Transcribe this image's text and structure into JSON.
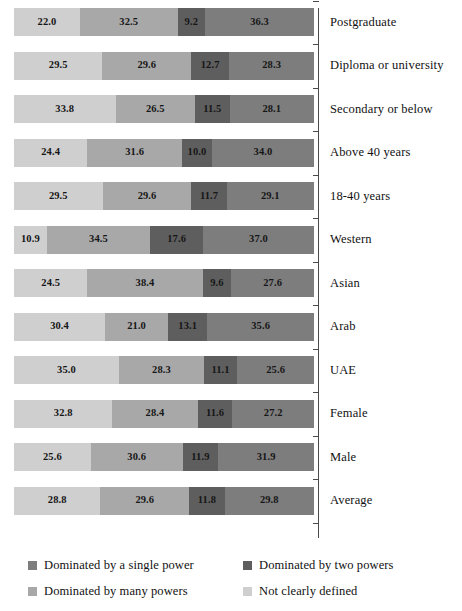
{
  "chart_data": {
    "type": "bar",
    "subtype": "horizontal-stacked-100",
    "title": "",
    "subtitle": "",
    "xlabel": "",
    "ylabel": "",
    "xlim": [
      0,
      100
    ],
    "grid": false,
    "legend_position": "bottom",
    "orientation": "horizontal",
    "categories": [
      "Postgraduate",
      "Diploma or university",
      "Secondary or below",
      "Above 40 years",
      "18-40 years",
      "Western",
      "Asian",
      "Arab",
      "UAE",
      "Female",
      "Male",
      "Average"
    ],
    "series": [
      {
        "name": "Not clearly defined",
        "color": "#cfcfcf",
        "values": [
          22.0,
          29.5,
          33.8,
          24.4,
          29.5,
          10.9,
          24.5,
          30.4,
          35.0,
          32.8,
          25.6,
          28.8
        ]
      },
      {
        "name": "Dominated by many powers",
        "color": "#a8a8a8",
        "values": [
          32.5,
          29.6,
          26.5,
          31.6,
          29.6,
          34.5,
          38.4,
          21.0,
          28.3,
          28.4,
          30.6,
          29.6
        ]
      },
      {
        "name": "Dominated by two powers",
        "color": "#5e5e5e",
        "values": [
          9.2,
          12.7,
          11.5,
          10.0,
          11.7,
          17.6,
          9.6,
          13.1,
          11.1,
          11.6,
          11.9,
          11.8
        ]
      },
      {
        "name": "Dominated by a single power",
        "color": "#7d7d7d",
        "values": [
          36.3,
          28.3,
          28.1,
          34.0,
          29.1,
          37.0,
          27.6,
          35.6,
          25.6,
          27.2,
          31.9,
          29.8
        ]
      }
    ],
    "rows": [
      {
        "category": "Postgraduate",
        "values": [
          22.0,
          32.5,
          9.2,
          36.3
        ]
      },
      {
        "category": "Diploma or university",
        "values": [
          29.5,
          29.6,
          12.7,
          28.3
        ]
      },
      {
        "category": "Secondary or below",
        "values": [
          33.8,
          26.5,
          11.5,
          28.1
        ]
      },
      {
        "category": "Above 40 years",
        "values": [
          24.4,
          31.6,
          10.0,
          34.0
        ]
      },
      {
        "category": "18-40 years",
        "values": [
          29.5,
          29.6,
          11.7,
          29.1
        ]
      },
      {
        "category": "Western",
        "values": [
          10.9,
          34.5,
          17.6,
          37.0
        ]
      },
      {
        "category": "Asian",
        "values": [
          24.5,
          38.4,
          9.6,
          27.6
        ]
      },
      {
        "category": "Arab",
        "values": [
          30.4,
          21.0,
          13.1,
          35.6
        ]
      },
      {
        "category": "UAE",
        "values": [
          35.0,
          28.3,
          11.1,
          25.6
        ]
      },
      {
        "category": "Female",
        "values": [
          32.8,
          28.4,
          11.6,
          27.2
        ]
      },
      {
        "category": "Male",
        "values": [
          25.6,
          30.6,
          11.9,
          31.9
        ]
      },
      {
        "category": "Average",
        "values": [
          28.8,
          29.6,
          11.8,
          29.8
        ]
      }
    ],
    "legend": [
      {
        "label": "Dominated by a single power",
        "color": "#7d7d7d"
      },
      {
        "label": "Dominated by two powers",
        "color": "#5e5e5e"
      },
      {
        "label": "Dominated by many powers",
        "color": "#a8a8a8"
      },
      {
        "label": "Not clearly defined",
        "color": "#cfcfcf"
      }
    ],
    "segment_colors": [
      "#cfcfcf",
      "#a8a8a8",
      "#5e5e5e",
      "#7d7d7d"
    ],
    "axis_color": "#4a4a4a"
  }
}
